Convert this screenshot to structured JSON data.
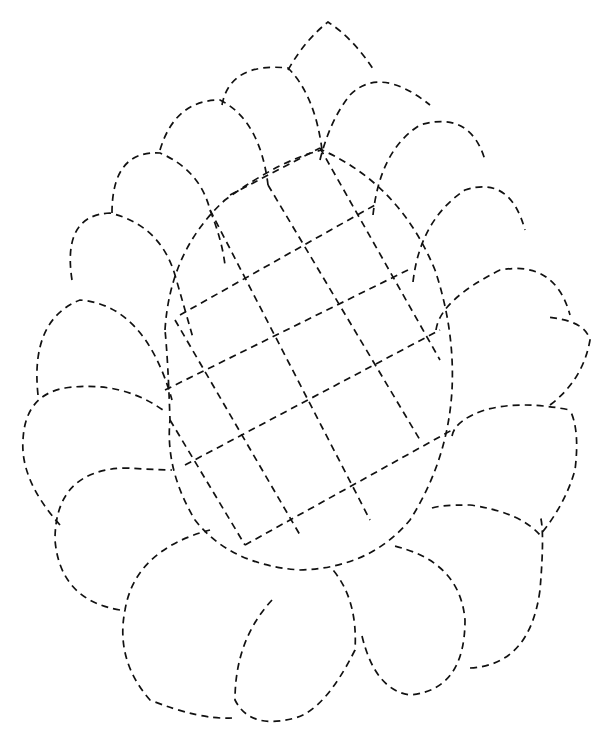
{
  "image": {
    "description": "Dashed-outline quilting pattern: pinecone/paisley shape with central lattice oval surrounded by scalloped petals",
    "stroke_color": "#111111",
    "background_color": "#ffffff",
    "line_style": "dashed"
  }
}
